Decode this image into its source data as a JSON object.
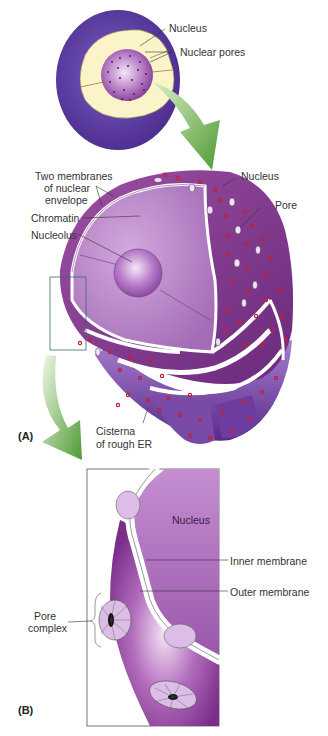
{
  "figure": {
    "panels": [
      {
        "id": "A",
        "label": "(A)"
      },
      {
        "id": "B",
        "label": "(B)"
      }
    ],
    "overview_labels": {
      "nucleus": "Nucleus",
      "nuclear_pores": "Nuclear pores"
    },
    "panel_a_labels": {
      "two_membranes_line1": "Two membranes",
      "two_membranes_line2": "of nuclear",
      "two_membranes_line3": "envelope",
      "chromatin": "Chromatin",
      "nucleolus": "Nucleolus",
      "nucleus": "Nucleus",
      "pore": "Pore",
      "cisterna_line1": "Cisterna",
      "cisterna_line2": "of rough ER"
    },
    "panel_b_labels": {
      "nucleus": "Nucleus",
      "inner_membrane": "Inner membrane",
      "outer_membrane": "Outer membrane",
      "pore_complex_line1": "Pore",
      "pore_complex_line2": "complex"
    },
    "colors": {
      "cell_purple": "#5b3a9e",
      "cytoplasm_cream": "#faf4c8",
      "nucleus_purple": "#9a5aa8",
      "nucleus_light": "#c79ad6",
      "envelope_dark": "#7e2f86",
      "ribosome_red": "#c0203a",
      "arrow_green": "#6fb24a",
      "membrane_white": "#ffffff"
    }
  }
}
